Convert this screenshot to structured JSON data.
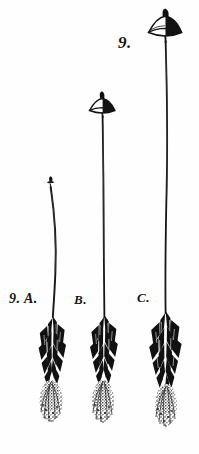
{
  "plate": {
    "number_label": "9.",
    "background_color": "#fefefe",
    "ink_color": "#101010",
    "width": 199,
    "height": 454,
    "medium": "engraving",
    "subject": "three growth stages of a stalked fungus with leafy scaled base and fibrous root mass"
  },
  "figures": [
    {
      "id": "A",
      "label": "9. A.",
      "label_short": "A.",
      "stage": "youngest",
      "cap_state": "unopened bud",
      "stalk_height_px": 130,
      "cap_top_y_px": 176,
      "base_center_x_px": 52
    },
    {
      "id": "B",
      "label": "B.",
      "label_short": "B.",
      "stage": "intermediate",
      "cap_state": "expanded parasol cap with apical papilla",
      "stalk_height_px": 215,
      "cap_top_y_px": 92,
      "base_center_x_px": 104
    },
    {
      "id": "C",
      "label": "C.",
      "label_short": "C.",
      "stage": "mature",
      "cap_state": "fully expanded parasol cap with apical papilla",
      "stalk_height_px": 290,
      "cap_top_y_px": 10,
      "base_center_x_px": 166
    }
  ],
  "icons": {
    "cap": "mushroom-cap-icon",
    "stalk": "stalk-icon",
    "leaves": "leaf-rosette-icon",
    "roots": "root-mass-icon"
  }
}
